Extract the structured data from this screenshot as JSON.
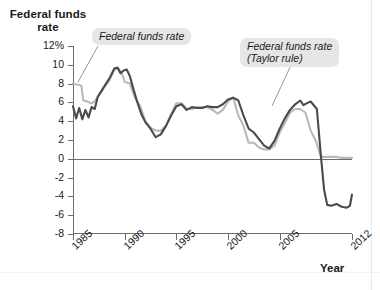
{
  "figure": {
    "y_axis_title": "Federal\nfunds rate",
    "x_axis_title": "Year"
  },
  "annotations": [
    {
      "id": "actual",
      "label": "Federal funds rate"
    },
    {
      "id": "taylor",
      "label": "Federal funds rate\n(Taylor rule)"
    }
  ],
  "colors": {
    "actual_line": "#b9b9b9",
    "taylor_line": "#4b4b4b",
    "axis": "#6d6d6d",
    "callout_bg": "#e6e6e6",
    "text": "#1a1a1a"
  },
  "chart_data": {
    "type": "line",
    "title": "Federal funds rate",
    "xlabel": "Year",
    "ylabel": "Federal funds rate",
    "xlim": [
      1985,
      2012
    ],
    "ylim": [
      -8,
      12
    ],
    "ytick_labels": [
      "12%",
      "10",
      "8",
      "6",
      "4",
      "2",
      "0",
      "-2",
      "-4",
      "-6",
      "-8"
    ],
    "ytick_values": [
      12,
      10,
      8,
      6,
      4,
      2,
      0,
      -2,
      -4,
      -6,
      -8
    ],
    "xtick_values": [
      1985,
      1990,
      1995,
      2000,
      2005,
      2012
    ],
    "xtick_labels": [
      "1985",
      "1990",
      "1995",
      "2000",
      "2005",
      "2012"
    ],
    "grid": false,
    "zero_line": true,
    "legend_position": "annotated-callouts",
    "series": [
      {
        "name": "Federal funds rate",
        "color": "#b9b9b9",
        "x": [
          1985.0,
          1985.4,
          1985.8,
          1986.0,
          1986.4,
          1986.8,
          1987.0,
          1987.4,
          1987.8,
          1988.0,
          1988.5,
          1989.0,
          1989.4,
          1989.8,
          1990.0,
          1990.5,
          1991.0,
          1991.5,
          1992.0,
          1992.5,
          1993.0,
          1993.5,
          1994.0,
          1994.5,
          1995.0,
          1995.5,
          1996.0,
          1996.5,
          1997.0,
          1997.5,
          1998.0,
          1998.5,
          1999.0,
          1999.5,
          2000.0,
          2000.5,
          2001.0,
          2001.5,
          2002.0,
          2002.5,
          2003.0,
          2003.5,
          2004.0,
          2004.5,
          2005.0,
          2005.5,
          2006.0,
          2006.5,
          2007.0,
          2007.5,
          2008.0,
          2008.5,
          2009.0,
          2009.5,
          2010.0,
          2010.5,
          2011.0,
          2011.5,
          2012.0
        ],
        "y": [
          8.0,
          7.9,
          7.8,
          6.2,
          6.1,
          5.9,
          6.0,
          6.6,
          7.2,
          7.6,
          8.3,
          9.5,
          9.6,
          8.9,
          8.2,
          8.0,
          6.5,
          5.6,
          4.0,
          3.3,
          3.0,
          3.0,
          3.5,
          4.8,
          5.9,
          5.9,
          5.3,
          5.3,
          5.5,
          5.5,
          5.5,
          5.2,
          4.8,
          5.2,
          6.1,
          6.5,
          4.6,
          3.5,
          1.7,
          1.7,
          1.2,
          1.0,
          1.0,
          1.4,
          2.8,
          3.8,
          4.9,
          5.3,
          5.3,
          4.9,
          3.0,
          1.9,
          0.2,
          0.2,
          0.2,
          0.2,
          0.1,
          0.1,
          0.1
        ]
      },
      {
        "name": "Federal funds rate (Taylor rule)",
        "color": "#4b4b4b",
        "x": [
          1985.0,
          1985.3,
          1985.6,
          1985.9,
          1986.2,
          1986.5,
          1986.8,
          1987.1,
          1987.4,
          1987.8,
          1988.2,
          1988.6,
          1989.0,
          1989.3,
          1989.6,
          1989.9,
          1990.2,
          1990.5,
          1990.8,
          1991.2,
          1991.6,
          1992.0,
          1992.5,
          1993.0,
          1993.5,
          1994.0,
          1994.5,
          1995.0,
          1995.5,
          1996.0,
          1996.5,
          1997.0,
          1997.5,
          1998.0,
          1998.5,
          1999.0,
          1999.5,
          2000.0,
          2000.5,
          2001.0,
          2001.5,
          2002.0,
          2002.5,
          2003.0,
          2003.5,
          2004.0,
          2004.5,
          2005.0,
          2005.5,
          2006.0,
          2006.5,
          2007.0,
          2007.3,
          2007.6,
          2008.0,
          2008.3,
          2008.6,
          2009.0,
          2009.3,
          2009.6,
          2010.0,
          2010.5,
          2011.0,
          2011.5,
          2011.8,
          2012.0
        ],
        "y": [
          5.6,
          4.3,
          5.4,
          4.2,
          5.2,
          4.4,
          5.5,
          5.3,
          6.6,
          7.3,
          8.0,
          8.7,
          9.6,
          9.7,
          9.1,
          9.4,
          9.5,
          8.8,
          7.6,
          6.1,
          4.8,
          3.9,
          3.2,
          2.3,
          2.6,
          3.5,
          4.6,
          5.6,
          5.8,
          5.2,
          5.5,
          5.4,
          5.4,
          5.6,
          5.5,
          5.5,
          5.8,
          6.3,
          6.5,
          6.2,
          4.6,
          3.2,
          2.8,
          2.1,
          1.4,
          1.1,
          1.9,
          3.2,
          4.3,
          5.2,
          5.8,
          6.2,
          5.7,
          5.9,
          6.1,
          5.7,
          5.3,
          0.2,
          -3.3,
          -4.9,
          -5.0,
          -4.8,
          -5.1,
          -5.2,
          -5.0,
          -3.8
        ]
      }
    ]
  }
}
